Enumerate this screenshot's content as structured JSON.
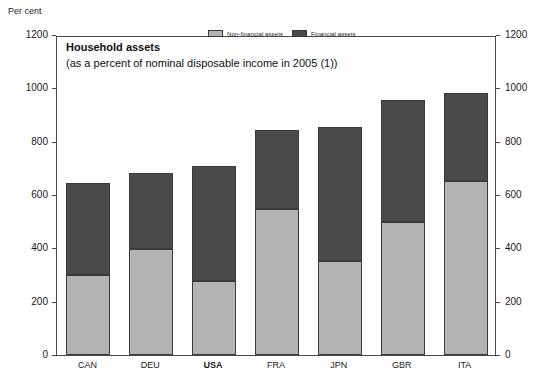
{
  "chart_data": {
    "type": "bar",
    "subtype": "stacked-bar",
    "title": "Household assets",
    "subtitle": "(as a percent of nominal disposable income in 2005 (1))",
    "unit_label": "Per cent",
    "xlabel": "",
    "ylabel": "Per cent",
    "ylim": [
      0,
      1200
    ],
    "yticks": [
      0,
      200,
      400,
      600,
      800,
      1000,
      1200
    ],
    "ytick_labels": [
      "0",
      "200",
      "400",
      "600",
      "800",
      "1000",
      "1200"
    ],
    "grid": false,
    "dual_axis": true,
    "legend_position": "top-center",
    "highlight_category": "USA",
    "categories": [
      "CAN",
      "DEU",
      "USA",
      "FRA",
      "JPN",
      "GBR",
      "ITA"
    ],
    "series": [
      {
        "name": "Non-financial assets",
        "color": "#b3b3b3",
        "values": [
          300,
          397,
          278,
          547,
          352,
          500,
          652
        ]
      },
      {
        "name": "Financial assets",
        "color": "#4a4a4a",
        "values": [
          345,
          285,
          431,
          296,
          503,
          456,
          331
        ]
      }
    ],
    "totals": [
      645,
      682,
      709,
      843,
      855,
      956,
      983
    ]
  },
  "legend": {
    "entries": [
      {
        "label": "Non-financial assets",
        "color": "#b3b3b3"
      },
      {
        "label": "Financial assets",
        "color": "#4a4a4a"
      }
    ]
  },
  "axis": {
    "unit": "Per cent",
    "left_ticks": [
      "1200",
      "1000",
      "800",
      "600",
      "400",
      "200",
      "0"
    ],
    "right_ticks": [
      "1200",
      "1000",
      "800",
      "600",
      "400",
      "200",
      "0"
    ]
  }
}
